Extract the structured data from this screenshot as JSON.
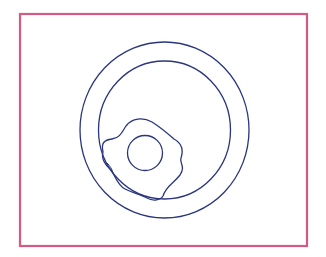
{
  "diagram": {
    "colors": {
      "frame": "#d45a84",
      "lines": "#2a3580",
      "background": "#ffffff"
    },
    "elements": [
      "frame",
      "outer-circle",
      "inner-circle",
      "cell-membrane",
      "cell-nucleus"
    ]
  }
}
